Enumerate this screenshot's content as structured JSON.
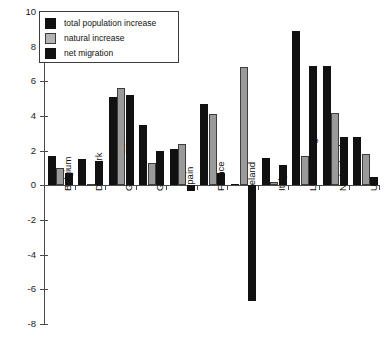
{
  "chart_data": {
    "type": "bar",
    "title": "",
    "subtitle": "",
    "xlabel": "",
    "ylabel": "",
    "ylim": [
      -8,
      10
    ],
    "ytick_step": 2,
    "yticks": [
      "10",
      "8",
      "6",
      "4",
      "2",
      "0",
      "-2",
      "-4",
      "-6",
      "-8"
    ],
    "grid": false,
    "legend_position": "upper-left",
    "categories": [
      "Belgium",
      "Denmark",
      "German FR",
      "Greece",
      "Spain",
      "France",
      "Ireland",
      "Italy",
      "Luxembourg",
      "Netherlands",
      "UK"
    ],
    "series": [
      {
        "name": "total population increase",
        "color": "#111111",
        "values": [
          1.7,
          1.5,
          5.1,
          3.5,
          2.1,
          4.7,
          0.1,
          1.6,
          8.9,
          6.9,
          2.8
        ]
      },
      {
        "name": "natural increase",
        "color": "#9a9a9a",
        "values": [
          1.0,
          0.1,
          5.6,
          1.3,
          2.4,
          4.1,
          6.8,
          0.2,
          1.7,
          4.2,
          1.8
        ]
      },
      {
        "name": "net migration",
        "color": "#111111",
        "values": [
          0.7,
          1.4,
          5.2,
          2.0,
          -0.3,
          0.7,
          -6.7,
          1.2,
          6.9,
          2.8,
          0.5
        ]
      }
    ]
  },
  "legend": {
    "items": [
      {
        "label": "total population increase",
        "swatch": "total"
      },
      {
        "label": "natural increase",
        "swatch": "natural"
      },
      {
        "label": "net migration",
        "swatch": "migration"
      }
    ]
  }
}
